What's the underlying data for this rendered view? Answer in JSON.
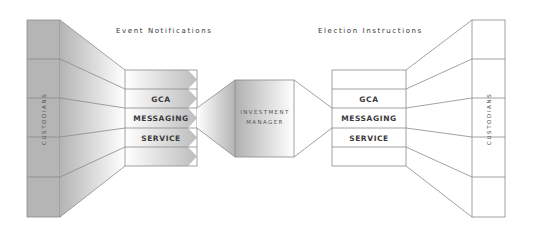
{
  "diagram": {
    "left": {
      "caption": "Event Notifications",
      "custodians_label": "CUSTODIANS",
      "gca_rows": [
        "",
        "GCA",
        "MESSAGING",
        "SERVICE",
        ""
      ]
    },
    "center": {
      "line1": "INVESTMENT",
      "line2": "MANAGER"
    },
    "right": {
      "caption": "Election Instructions",
      "custodians_label": "CUSTODIANS",
      "gca_rows": [
        "",
        "GCA",
        "MESSAGING",
        "SERVICE",
        ""
      ]
    },
    "colors": {
      "shade": "#b8b8b8",
      "shade_light": "#ffffff",
      "line": "#8a8a8a",
      "text": "#3a3a3a"
    }
  }
}
